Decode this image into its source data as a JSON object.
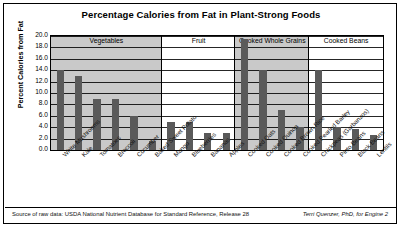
{
  "chart_data": {
    "type": "bar",
    "title": "Percentage Calories from Fat in Plant-Strong Foods",
    "xlabel": "",
    "ylabel": "Percent Calories from Fat",
    "ylim": [
      0.0,
      20.0
    ],
    "ytick_step": 2.0,
    "yticks": [
      "20.0",
      "18.0",
      "16.0",
      "14.0",
      "12.0",
      "10.0",
      "8.0",
      "6.0",
      "4.0",
      "2.0",
      "0.0"
    ],
    "grid": true,
    "legend": "none",
    "categories": [
      "White Mushrooms",
      "Kale",
      "Tomatoes",
      "Broccoli",
      "Cucumber",
      "Baked Sweet Potato",
      "Mango",
      "Blueberries",
      "Bananas",
      "Apples",
      "Cooked Oats",
      "Cooked Quinoa",
      "Cooked Brown Rice",
      "Cooked Pearled Barley",
      "Chickpeas (Garbanzos)",
      "Pinto Beans",
      "Black Beans",
      "Lentils"
    ],
    "values": [
      14.0,
      13.0,
      9.0,
      9.0,
      6.0,
      1.5,
      5.0,
      5.0,
      3.0,
      3.0,
      19.5,
      14.0,
      7.0,
      4.0,
      14.0,
      4.0,
      3.6,
      2.6
    ],
    "groups": [
      {
        "label": "Vegetables",
        "count": 6,
        "shaded": true
      },
      {
        "label": "Fruit",
        "count": 4,
        "shaded": false
      },
      {
        "label": "Cooked Whole Grains",
        "count": 4,
        "shaded": true
      },
      {
        "label": "Cooked Beans",
        "count": 4,
        "shaded": false
      }
    ],
    "bar_color": "#5a5a5a",
    "band_shade_color": "#c9c9c9"
  },
  "footer": {
    "source": "Source of raw data: USDA National Nutrient Database for Standard Reference, Release 28",
    "credit": "Terri Quenzer, PhD, for Engine 2"
  }
}
